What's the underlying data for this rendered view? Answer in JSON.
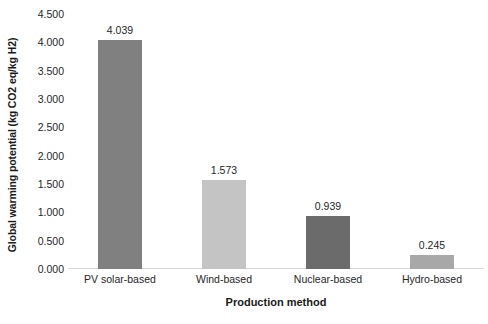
{
  "chart_data": {
    "type": "bar",
    "title": "",
    "xlabel": "Production method",
    "ylabel": "Global warming potential (kg CO2 eq/kg H2)",
    "categories": [
      "PV solar-based",
      "Wind-based",
      "Nuclear-based",
      "Hydro-based"
    ],
    "values": [
      4.039,
      1.573,
      0.939,
      0.245
    ],
    "value_labels": [
      "4.039",
      "1.573",
      "0.939",
      "0.245"
    ],
    "bar_colors": [
      "#808080",
      "#c4c4c4",
      "#6b6b6b",
      "#a8a8a8"
    ],
    "ylim": [
      0.0,
      4.5
    ],
    "ytick_values": [
      0.0,
      0.5,
      1.0,
      1.5,
      2.0,
      2.5,
      3.0,
      3.5,
      4.0,
      4.5
    ],
    "ytick_labels": [
      "0.000",
      "0.500",
      "1.000",
      "1.500",
      "2.000",
      "2.500",
      "3.000",
      "3.500",
      "4.000",
      "4.500"
    ],
    "grid": false,
    "legend": false,
    "baseline_color": "#d8d8d8",
    "background": "#ffffff"
  }
}
